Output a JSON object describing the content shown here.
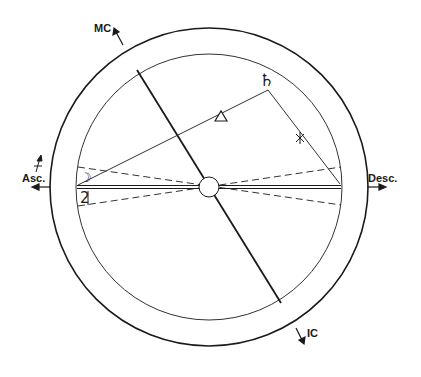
{
  "diagram": {
    "type": "astrological-chart-wheel",
    "axes": {
      "mc_label": "MC",
      "ic_label": "IC",
      "asc_label": "Asc.",
      "desc_label": "Desc."
    },
    "planets": {
      "saturn_glyph": "♄",
      "jupiter_glyph": "2̸",
      "moon_glyph": "☽"
    },
    "aspects": {
      "trine_glyph": "△",
      "sextile_glyph": "✱"
    },
    "colors": {
      "ink": "#1a1a1a",
      "background": "#ffffff"
    }
  }
}
